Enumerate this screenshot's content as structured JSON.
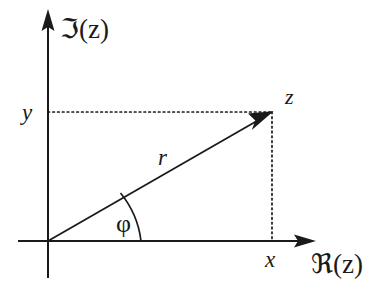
{
  "figure": {
    "background_color": "#ffffff",
    "ink_color": "#1a1a1a",
    "width": 379,
    "height": 286
  },
  "axes": {
    "origin": {
      "x": 48,
      "y": 241
    },
    "vertical": {
      "label": "ℑ(z)",
      "label_plain": "Im(z)",
      "label_x": 60,
      "label_y": 38,
      "from_y": 278,
      "to_y": 14,
      "x": 48
    },
    "horizontal": {
      "label": "ℜ(z)",
      "label_plain": "Re(z)",
      "label_x": 311,
      "label_y": 273,
      "from_x": 18,
      "to_x": 312,
      "y": 241
    }
  },
  "point": {
    "label": "z",
    "label_x": 285,
    "label_y": 104,
    "x": 272,
    "y": 112
  },
  "vector": {
    "label": "r",
    "label_x": 158,
    "label_y": 165,
    "from_x": 48,
    "from_y": 241,
    "to_x": 272,
    "to_y": 112
  },
  "angle": {
    "label": "φ",
    "label_plain": "phi",
    "label_x": 116,
    "label_y": 232,
    "arc_radius": 93
  },
  "projections": [
    {
      "label": "y",
      "axis": "imaginary",
      "label_x": 22,
      "label_y": 120,
      "dotted_from_x": 48,
      "dotted_to_x": 272,
      "dotted_y": 112
    },
    {
      "label": "x",
      "axis": "real",
      "label_x": 265,
      "label_y": 267,
      "dotted_x": 272,
      "dotted_from_y": 112,
      "dotted_to_y": 241
    }
  ]
}
